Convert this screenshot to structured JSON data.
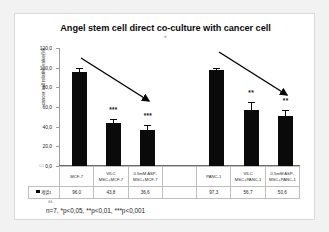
{
  "chart_data": {
    "type": "bar",
    "title": "Angel stem cell direct co-culture with cancer cell",
    "title_marker": "※",
    "xlabel": "",
    "ylabel": "cancer cell relative value(%)",
    "ylim": [
      0,
      120
    ],
    "ytick_labels": [
      "120,0",
      "100,0",
      "80,0",
      "60,0",
      "40,0",
      "20,0",
      "0,0"
    ],
    "ytick_values": [
      120,
      100,
      80,
      60,
      40,
      20,
      0
    ],
    "grid": false,
    "legend_position": "bottom-table",
    "series_name": "계열1",
    "categories": [
      "MCF-7",
      "VILC\nMSC+MCF-7",
      "0.5mM ASP-\nMSC+MCF-7",
      "",
      "PANC-1",
      "VILC\nMSC+PANC-1",
      "0.5mM ASP-\nMSC+PANC-1"
    ],
    "values": [
      96.0,
      43.8,
      36.6,
      null,
      97.3,
      56.7,
      50.6
    ],
    "value_labels": [
      "96,0",
      "43,8",
      "36,6",
      "",
      "97,3",
      "56,7",
      "50,6"
    ],
    "errors": [
      3.0,
      2.8,
      4.0,
      null,
      1.2,
      7.0,
      5.0
    ],
    "significance": [
      "",
      "***",
      "***",
      "",
      "",
      "**",
      "**"
    ],
    "annotations": [
      {
        "name": "arrow-mcf7",
        "text": "decline arrow over MCF-7 group"
      },
      {
        "name": "arrow-panc1",
        "text": "decline arrow over PANC-1 group"
      }
    ],
    "footnote": "n=7, *p<0,05, **p<0,01, ***p<0,001",
    "axis_corner_mark": "CC",
    "footnote_marker": "AA"
  },
  "table": {
    "rows": [
      {
        "name": "category-row",
        "cells": [
          "MCF-7",
          "VILC\nMSC+MCF-7",
          "0.5mM ASP-\nMSC+MCF-7",
          "",
          "PANC-1",
          "VILC\nMSC+PANC-1",
          "0.5mM ASP-\nMSC+PANC-1"
        ]
      },
      {
        "name": "value-row",
        "legend_label": "계열1",
        "cells": [
          "96,0",
          "43,8",
          "36,6",
          "",
          "97,3",
          "56,7",
          "50,6"
        ]
      }
    ]
  },
  "colors": {
    "bar": "#0a0a0a",
    "background": "#ffffff",
    "page": "#f2f2f2",
    "grid": "#bfbfbf",
    "text": "#1a1a1a"
  }
}
